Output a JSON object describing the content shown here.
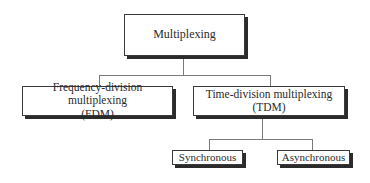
{
  "diagram": {
    "type": "tree",
    "root": {
      "label": "Multiplexing"
    },
    "level1": [
      {
        "line1": "Frequency-division multiplexing",
        "line2": "(FDM)"
      },
      {
        "line1": "Time-division multiplexing",
        "line2": "(TDM)"
      }
    ],
    "level2": [
      {
        "label": "Synchronous",
        "parent": "(TDM)"
      },
      {
        "label": "Asynchronous",
        "parent": "(TDM)"
      }
    ],
    "colors": {
      "box_border": "#3a3a3a",
      "box_shadow": "#2b2b2b",
      "connector": "#7a7a7a",
      "text": "#2a2a2a",
      "background": "#ffffff"
    }
  }
}
